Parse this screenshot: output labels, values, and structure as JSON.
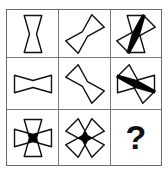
{
  "puzzle": {
    "type": "matrix-reasoning",
    "title": "Figure Matrix Puzzle",
    "grid": {
      "rows": 3,
      "cols": 3
    },
    "stroke_color": "#111111",
    "fill_color": "#000000",
    "border_color": "#6b6b6b",
    "grid_line_color": "#7a7a7a",
    "background_color": "#ffffff",
    "cells": [
      {
        "index": 1,
        "row": 1,
        "col": 1,
        "description": "vertical hourglass",
        "shapes": [
          "hourglass-vertical"
        ],
        "rotations": [
          0
        ],
        "filled_intersection": false,
        "label": ""
      },
      {
        "index": 2,
        "row": 1,
        "col": 2,
        "description": "hourglass rotated 45 degrees",
        "shapes": [
          "hourglass-diagonal-right"
        ],
        "rotations": [
          45
        ],
        "filled_intersection": false,
        "label": ""
      },
      {
        "index": 3,
        "row": 1,
        "col": 3,
        "description": "vertical hourglass overlaid with 45 degree hourglass, black intersection",
        "shapes": [
          "hourglass-vertical",
          "hourglass-diagonal-right"
        ],
        "rotations": [
          0,
          45
        ],
        "filled_intersection": true,
        "label": ""
      },
      {
        "index": 4,
        "row": 2,
        "col": 1,
        "description": "horizontal hourglass",
        "shapes": [
          "hourglass-horizontal"
        ],
        "rotations": [
          90
        ],
        "filled_intersection": false,
        "label": ""
      },
      {
        "index": 5,
        "row": 2,
        "col": 2,
        "description": "hourglass rotated 135 degrees",
        "shapes": [
          "hourglass-diagonal-left"
        ],
        "rotations": [
          135
        ],
        "filled_intersection": false,
        "label": ""
      },
      {
        "index": 6,
        "row": 2,
        "col": 3,
        "description": "horizontal hourglass overlaid with 135 degree hourglass, black intersection",
        "shapes": [
          "hourglass-horizontal",
          "hourglass-diagonal-left"
        ],
        "rotations": [
          90,
          135
        ],
        "filled_intersection": true,
        "label": ""
      },
      {
        "index": 7,
        "row": 3,
        "col": 1,
        "description": "vertical and horizontal hourglasses overlaid forming a cross, black square center",
        "shapes": [
          "hourglass-vertical",
          "hourglass-horizontal"
        ],
        "rotations": [
          0,
          90
        ],
        "filled_intersection": true,
        "label": ""
      },
      {
        "index": 8,
        "row": 3,
        "col": 2,
        "description": "both diagonal hourglasses overlaid forming an X star, black diamond center",
        "shapes": [
          "hourglass-diagonal-right",
          "hourglass-diagonal-left"
        ],
        "rotations": [
          45,
          135
        ],
        "filled_intersection": true,
        "label": ""
      },
      {
        "index": 9,
        "row": 3,
        "col": 3,
        "description": "missing answer cell showing a question mark",
        "shapes": [],
        "rotations": [],
        "filled_intersection": false,
        "label": "?"
      }
    ]
  }
}
